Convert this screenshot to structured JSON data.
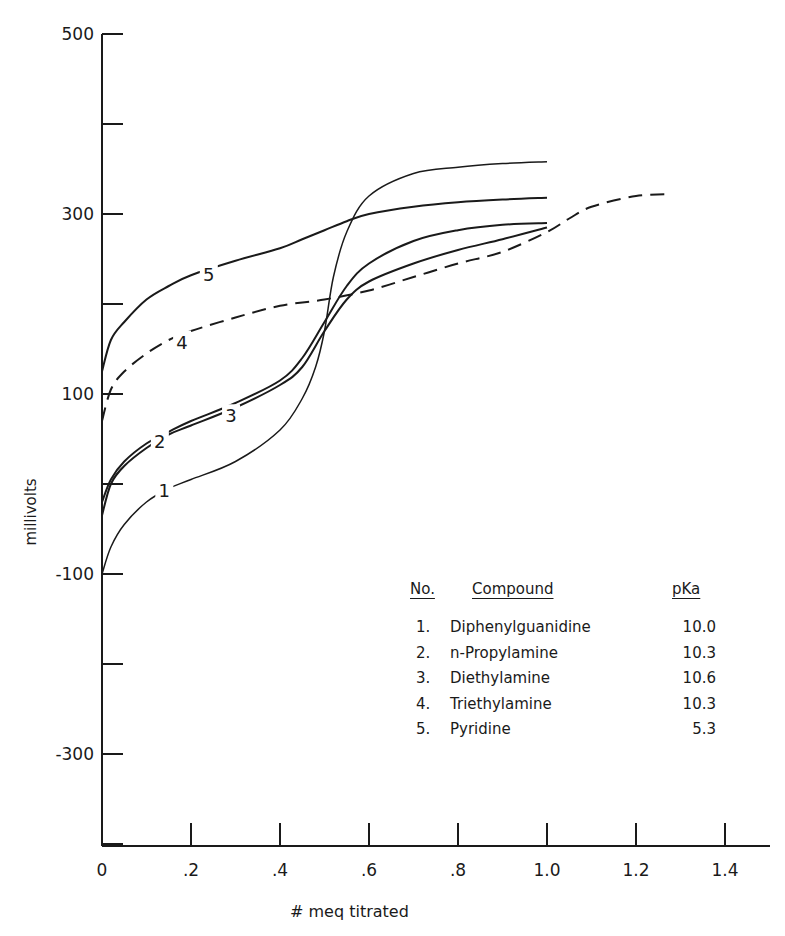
{
  "chart_data": {
    "type": "line",
    "title": "",
    "xlabel": "# meq titrated",
    "ylabel": "millivolts",
    "xlim": [
      0,
      1.5
    ],
    "ylim": [
      -400,
      500
    ],
    "x_ticks": [
      0,
      0.2,
      0.4,
      0.6,
      0.8,
      1.0,
      1.2,
      1.4
    ],
    "x_tick_labels": [
      "0",
      ".2",
      ".4",
      ".6",
      ".8",
      "1.0",
      "1.2",
      "1.4"
    ],
    "y_ticks": [
      500,
      400,
      300,
      200,
      100,
      0,
      -100,
      -200,
      -300,
      -400
    ],
    "y_tick_labels": [
      "500",
      "",
      "300",
      "",
      "100",
      "",
      "-100",
      "",
      "-300",
      ""
    ],
    "grid": false,
    "legend_position": "lower right (table)",
    "series": [
      {
        "name": "1. Diphenylguanidine",
        "label": "1",
        "style": "solid",
        "pka": "10.0",
        "x": [
          0,
          0.02,
          0.05,
          0.1,
          0.15,
          0.2,
          0.3,
          0.4,
          0.45,
          0.48,
          0.5,
          0.52,
          0.55,
          0.6,
          0.7,
          0.8,
          0.9,
          1.0
        ],
        "y": [
          -100,
          -70,
          -45,
          -20,
          -5,
          5,
          25,
          60,
          95,
          130,
          170,
          230,
          280,
          320,
          345,
          352,
          356,
          358
        ]
      },
      {
        "name": "2. n-Propylamine",
        "label": "2",
        "style": "solid",
        "pka": "10.3",
        "x": [
          0,
          0.02,
          0.05,
          0.1,
          0.15,
          0.2,
          0.3,
          0.4,
          0.45,
          0.5,
          0.55,
          0.6,
          0.7,
          0.8,
          0.9,
          1.0
        ],
        "y": [
          -20,
          5,
          25,
          45,
          58,
          70,
          90,
          115,
          140,
          180,
          220,
          245,
          270,
          282,
          288,
          290
        ]
      },
      {
        "name": "3. Diethylamine",
        "label": "3",
        "style": "solid",
        "pka": "10.6",
        "x": [
          0,
          0.02,
          0.05,
          0.1,
          0.15,
          0.2,
          0.3,
          0.4,
          0.45,
          0.5,
          0.55,
          0.6,
          0.7,
          0.8,
          0.9,
          1.0
        ],
        "y": [
          -35,
          0,
          20,
          40,
          55,
          65,
          85,
          110,
          130,
          170,
          205,
          225,
          245,
          260,
          272,
          285
        ]
      },
      {
        "name": "4. Triethylamine",
        "label": "4",
        "style": "dashed",
        "pka": "10.3",
        "x": [
          0,
          0.02,
          0.05,
          0.1,
          0.15,
          0.2,
          0.3,
          0.4,
          0.5,
          0.6,
          0.7,
          0.8,
          0.9,
          1.0,
          1.05,
          1.1,
          1.2,
          1.28
        ],
        "y": [
          70,
          105,
          125,
          145,
          160,
          170,
          185,
          198,
          205,
          215,
          230,
          245,
          258,
          280,
          295,
          308,
          320,
          322
        ]
      },
      {
        "name": "5. Pyridine",
        "label": "5",
        "style": "solid",
        "pka": "5.3",
        "x": [
          0,
          0.02,
          0.05,
          0.1,
          0.15,
          0.2,
          0.3,
          0.4,
          0.45,
          0.5,
          0.55,
          0.6,
          0.7,
          0.8,
          0.9,
          1.0
        ],
        "y": [
          125,
          160,
          180,
          205,
          220,
          232,
          248,
          262,
          272,
          282,
          292,
          300,
          308,
          313,
          316,
          318
        ]
      }
    ],
    "legend_table": {
      "headers": [
        "No.",
        "Compound",
        "pKa"
      ],
      "rows": [
        [
          "1.",
          "Diphenylguanidine",
          "10.0"
        ],
        [
          "2.",
          "n-Propylamine",
          "10.3"
        ],
        [
          "3.",
          "Diethylamine",
          "10.6"
        ],
        [
          "4.",
          "Triethylamine",
          "10.3"
        ],
        [
          "5.",
          "Pyridine",
          "5.3"
        ]
      ]
    }
  },
  "labels": {
    "x_axis_title": "# meq titrated",
    "y_axis_title": "millivolts",
    "legend_header_no": "No.",
    "legend_header_compound": "Compound",
    "legend_header_pka": "pKa"
  },
  "legend": {
    "rows": [
      {
        "no": "1.",
        "compound": "Diphenylguanidine",
        "pka": "10.0"
      },
      {
        "no": "2.",
        "compound": "n-Propylamine",
        "pka": "10.3"
      },
      {
        "no": "3.",
        "compound": "Diethylamine",
        "pka": "10.6"
      },
      {
        "no": "4.",
        "compound": "Triethylamine",
        "pka": "10.3"
      },
      {
        "no": "5.",
        "compound": "Pyridine",
        "pka": "5.3"
      }
    ]
  },
  "colors": {
    "ink": "#1a1a1a",
    "background": "#ffffff"
  }
}
